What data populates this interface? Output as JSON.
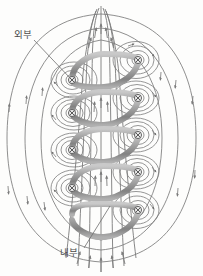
{
  "figure": {
    "type": "magnetic-field-solenoid-diagram",
    "background_color": "#fdfdfc"
  },
  "labels": {
    "exterior": {
      "text": "외부",
      "x": 14,
      "y": 38,
      "leader_from": [
        34,
        40
      ],
      "leader_to": [
        68,
        76
      ]
    },
    "interior": {
      "text": "내부",
      "x": 62,
      "y": 256,
      "leader_from": [
        84,
        250
      ],
      "leader_to": [
        108,
        208
      ]
    }
  },
  "colors": {
    "field_line": "#7b7b7b",
    "coil_band": "#9a9a9a",
    "coil_band_dark": "#6f6f6f",
    "coil_band_light": "#c4c4c4",
    "marker_stroke": "#5a5a5a",
    "label_text": "#4a4a4a",
    "background": "#fdfdfc"
  },
  "coil": {
    "turns": 6,
    "axis_x": 101,
    "left_x": 68,
    "right_x": 136,
    "top_y": 62,
    "pitch": 33,
    "band_width": 6,
    "current_symbol": "cross-in-circle",
    "current_direction": "into-page-on-both-sides"
  },
  "current_markers": {
    "symbol": "⊗",
    "left_side": [
      {
        "x": 72,
        "y": 80
      },
      {
        "x": 72,
        "y": 113
      },
      {
        "x": 72,
        "y": 150
      },
      {
        "x": 72,
        "y": 188
      }
    ],
    "right_side": [
      {
        "x": 138,
        "y": 60
      },
      {
        "x": 138,
        "y": 98
      },
      {
        "x": 138,
        "y": 135
      },
      {
        "x": 138,
        "y": 172
      },
      {
        "x": 138,
        "y": 210
      }
    ]
  },
  "field": {
    "interior_direction": "upward",
    "exterior_direction": "downward-return",
    "interior_line_count": 7,
    "outer_loop_count": 3,
    "arrow_glyph": "triangle",
    "description_interior": "균일한 상향 자기장",
    "description_exterior": "바깥으로 되돌아오는 자기장"
  }
}
